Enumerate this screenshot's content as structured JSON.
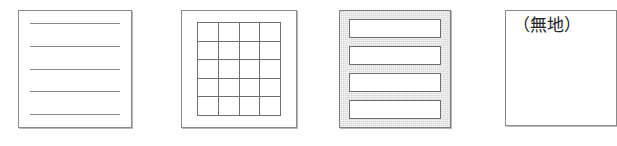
{
  "figure": {
    "samples": [
      {
        "id": "ruled",
        "name": "ruled-paper-sample",
        "label": "",
        "pattern": "horizontal-rules",
        "line_count": 5,
        "line_color": "#888b8d",
        "background": "#ffffff",
        "border_color": "#8a8a8a"
      },
      {
        "id": "grid",
        "name": "grid-paper-sample",
        "label": "",
        "pattern": "square-grid",
        "columns": 4,
        "rows": 5,
        "line_color": "#6f6f6f",
        "background": "#ffffff",
        "border_color": "#8a8a8a"
      },
      {
        "id": "bands",
        "name": "banded-paper-sample",
        "label": "",
        "pattern": "white-bands-on-gray",
        "band_count": 4,
        "band_color": "#ffffff",
        "background": "#d6d6d6",
        "border_color": "#7d7d7d"
      },
      {
        "id": "plain",
        "name": "plain-paper-sample",
        "label": "（無地）",
        "pattern": "blank",
        "background": "#ffffff",
        "border_color": "#8a8a8a"
      }
    ]
  }
}
